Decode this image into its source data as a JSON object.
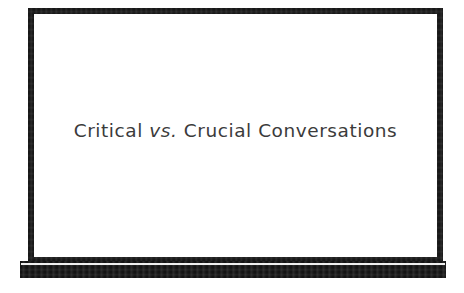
{
  "slide": {
    "title_full": "Critical vs. Crucial Conversations",
    "title_parts": {
      "before": "Critical ",
      "emphasis": "vs.",
      "after": " Crucial Conversations"
    },
    "background_color": "#ffffff",
    "board": {
      "surface_color": "#ffffff",
      "frame_color": "#171717",
      "base_color": "#141414",
      "base_highlight_color": "#efefef",
      "text_color": "#3b3b3b"
    }
  }
}
